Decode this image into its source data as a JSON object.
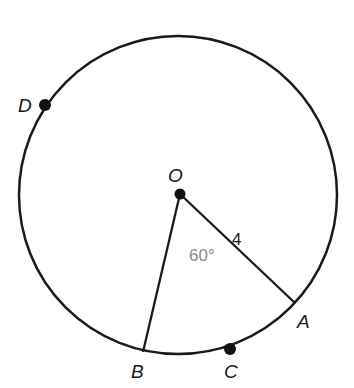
{
  "figure": {
    "points": [
      {
        "id": "O",
        "label": "O",
        "role": "center"
      },
      {
        "id": "A",
        "label": "A",
        "role": "on-circle"
      },
      {
        "id": "B",
        "label": "B",
        "role": "on-circle"
      },
      {
        "id": "C",
        "label": "C",
        "role": "on-circle"
      },
      {
        "id": "D",
        "label": "D",
        "role": "on-circle"
      }
    ],
    "segments": [
      {
        "from": "O",
        "to": "A",
        "length_label": "4"
      },
      {
        "from": "O",
        "to": "B"
      }
    ],
    "angle": {
      "vertex": "O",
      "between": [
        "A",
        "B"
      ],
      "label": "60°"
    },
    "radius_label": "4"
  }
}
